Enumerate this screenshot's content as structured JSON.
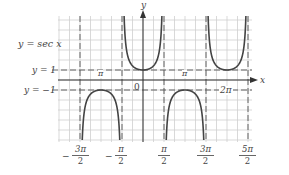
{
  "chart_data": {
    "type": "line",
    "title": "",
    "function_label": "y = sec x",
    "xlabel": "x",
    "ylabel": "y",
    "x_tick_labels": [
      "-3π/2",
      "-π/2",
      "π/2",
      "3π/2",
      "5π/2"
    ],
    "x_axis_inline_labels": [
      "-π",
      "0",
      "π",
      "2π"
    ],
    "y_reference_lines": [
      {
        "label": "y = 1",
        "value": 1
      },
      {
        "label": "y = -1",
        "value": -1
      }
    ],
    "asymptotes": [
      "-3π/2",
      "-π/2",
      "π/2",
      "3π/2",
      "5π/2"
    ],
    "branches": [
      {
        "interval": [
          "-3π/2",
          "-π/2"
        ],
        "direction": "down",
        "vertex": [
          -3.1416,
          -1
        ]
      },
      {
        "interval": [
          "-π/2",
          "π/2"
        ],
        "direction": "up",
        "vertex": [
          0,
          1
        ]
      },
      {
        "interval": [
          "π/2",
          "3π/2"
        ],
        "direction": "down",
        "vertex": [
          3.1416,
          -1
        ]
      },
      {
        "interval": [
          "3π/2",
          "5π/2"
        ],
        "direction": "up",
        "vertex": [
          6.2832,
          1
        ]
      }
    ],
    "grid": true,
    "colors": {
      "curve": "#444444",
      "grid": "#c8c8c8",
      "axis": "#333333",
      "dashed": "#555555"
    }
  },
  "labels": {
    "function": "y = sec x",
    "y_equals_1": "y = 1",
    "y_equals_neg1": "y = −1",
    "axis_x": "x",
    "axis_y": "y",
    "origin": "0",
    "neg_pi": "π",
    "pi": "π",
    "two_pi": "2π",
    "ticks": [
      {
        "minus": "−",
        "num": "3π",
        "den": "2"
      },
      {
        "minus": "−",
        "num": "π",
        "den": "2"
      },
      {
        "minus": "",
        "num": "π",
        "den": "2"
      },
      {
        "minus": "",
        "num": "3π",
        "den": "2"
      },
      {
        "minus": "",
        "num": "5π",
        "den": "2"
      }
    ]
  }
}
